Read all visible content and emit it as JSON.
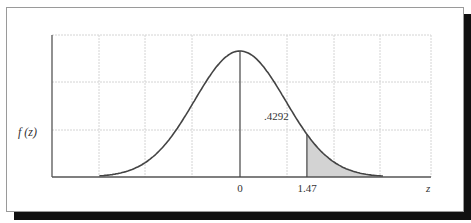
{
  "chart_data": {
    "type": "area",
    "title": "",
    "xlabel": "z",
    "ylabel": "f(z)",
    "curve": "standard normal density",
    "mean": 0,
    "x_tick_labels": [
      "0",
      "1.47"
    ],
    "x_ticks": [
      0,
      1.47
    ],
    "xlim": [
      -4,
      4
    ],
    "shaded_region": {
      "from": 1.47,
      "to": "right tail",
      "color": "#d3d3d3"
    },
    "annotations": [
      {
        "text": ".4292",
        "position": "left of z=1.47 line, area between 0 and 1.47"
      }
    ],
    "area_between_0_and_z": 0.4292,
    "grid": true,
    "legend": null
  },
  "labels": {
    "y_axis": "f (z)",
    "x_axis": "z",
    "tick_zero": "0",
    "tick_z": "1.47",
    "area_annotation": ".4292"
  },
  "colors": {
    "curve": "#444444",
    "shade": "#d3d3d3",
    "grid": "#cccccc",
    "axis": "#555555",
    "shadow": "#111111"
  }
}
